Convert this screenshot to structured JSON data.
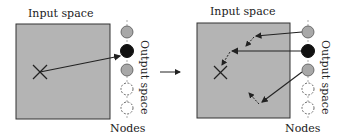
{
  "panels": [
    {
      "id": "before",
      "input_label": "Input space",
      "output_label": "Output space",
      "nodes_label": "Nodes",
      "nodes": [
        {
          "state": "neighbor",
          "color": "#a8a8a8"
        },
        {
          "state": "winner",
          "color": "#111111"
        },
        {
          "state": "neighbor",
          "color": "#a8a8a8"
        },
        {
          "state": "inactive",
          "color": "#ffffff"
        },
        {
          "state": "inactive",
          "color": "#ffffff"
        }
      ],
      "marker": "X"
    },
    {
      "id": "after",
      "input_label": "Input space",
      "output_label": "Output space",
      "nodes_label": "Nodes",
      "nodes": [
        {
          "state": "neighbor",
          "color": "#a8a8a8"
        },
        {
          "state": "winner",
          "color": "#111111"
        },
        {
          "state": "neighbor",
          "color": "#a8a8a8"
        },
        {
          "state": "inactive",
          "color": "#ffffff"
        },
        {
          "state": "inactive",
          "color": "#ffffff"
        }
      ],
      "marker": "X"
    }
  ],
  "colors": {
    "input_space_fill": "#b4b4b4",
    "stroke": "#222222"
  },
  "transition_arrow": "right-arrow"
}
